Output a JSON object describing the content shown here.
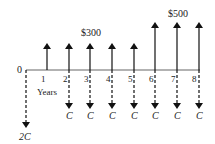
{
  "diagram": {
    "type": "cash-flow-diagram",
    "axis_label": "Years",
    "origin_label": "0",
    "periods": [
      "1",
      "2",
      "3",
      "4",
      "5",
      "6",
      "7",
      "8"
    ],
    "inflow_labels": {
      "small": "$300",
      "large": "$500"
    },
    "outflow_label": "C",
    "initial_outflow_label": "2C",
    "inflows": [
      {
        "year": 1,
        "amount": "$300"
      },
      {
        "year": 2,
        "amount": "$300"
      },
      {
        "year": 3,
        "amount": "$300"
      },
      {
        "year": 4,
        "amount": "$300"
      },
      {
        "year": 5,
        "amount": "$300"
      },
      {
        "year": 6,
        "amount": "$500"
      },
      {
        "year": 7,
        "amount": "$500"
      },
      {
        "year": 8,
        "amount": "$500"
      }
    ],
    "outflows": [
      {
        "year": 0,
        "amount": "2C"
      },
      {
        "year": 2,
        "amount": "C"
      },
      {
        "year": 3,
        "amount": "C"
      },
      {
        "year": 4,
        "amount": "C"
      },
      {
        "year": 5,
        "amount": "C"
      },
      {
        "year": 6,
        "amount": "C"
      },
      {
        "year": 7,
        "amount": "C"
      },
      {
        "year": 8,
        "amount": "C"
      }
    ]
  }
}
